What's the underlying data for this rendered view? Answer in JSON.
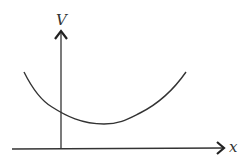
{
  "diagram": {
    "title": "",
    "y_axis_label": "V",
    "x_axis_label": "x",
    "stroke_color": "#333333",
    "background_color": "#ffffff",
    "curve": {
      "description": "U-shaped potential energy curve with minimum to the right of the V axis",
      "points": [
        [
          24,
          72
        ],
        [
          40,
          98
        ],
        [
          61,
          113
        ],
        [
          100,
          124
        ],
        [
          125,
          120
        ],
        [
          160,
          101
        ],
        [
          186,
          72
        ]
      ]
    }
  }
}
